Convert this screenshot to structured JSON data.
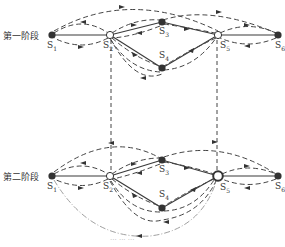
{
  "stages": [
    {
      "label": "第一阶段",
      "y": 35
    },
    {
      "label": "第二阶段",
      "y": 176
    }
  ],
  "nodes": {
    "stage1": [
      {
        "id": "S1",
        "name": "S",
        "sub": "1",
        "x": 52,
        "y": 35,
        "style": "filled"
      },
      {
        "id": "S2",
        "name": "S",
        "sub": "2",
        "x": 110,
        "y": 35,
        "style": "hollow"
      },
      {
        "id": "S3",
        "name": "S",
        "sub": "3",
        "x": 162,
        "y": 22,
        "style": "filled"
      },
      {
        "id": "S4",
        "name": "S",
        "sub": "4",
        "x": 162,
        "y": 68,
        "style": "filled"
      },
      {
        "id": "S5",
        "name": "S",
        "sub": "5",
        "x": 218,
        "y": 35,
        "style": "hollow"
      },
      {
        "id": "S6",
        "name": "S",
        "sub": "6",
        "x": 278,
        "y": 35,
        "style": "filled"
      }
    ],
    "stage2": [
      {
        "id": "S1",
        "name": "S",
        "sub": "1",
        "x": 52,
        "y": 176,
        "style": "filled"
      },
      {
        "id": "S2",
        "name": "S",
        "sub": "2",
        "x": 110,
        "y": 176,
        "style": "hollow"
      },
      {
        "id": "S3",
        "name": "S",
        "sub": "3",
        "x": 162,
        "y": 160,
        "style": "filled"
      },
      {
        "id": "S4",
        "name": "S",
        "sub": "4",
        "x": 162,
        "y": 208,
        "style": "filled"
      },
      {
        "id": "S5",
        "name": "S",
        "sub": "5",
        "x": 218,
        "y": 176,
        "style": "hollow-thick"
      },
      {
        "id": "S6",
        "name": "S",
        "sub": "6",
        "x": 278,
        "y": 176,
        "style": "filled"
      }
    ]
  },
  "edges_solid": [
    [
      "S1",
      "S2"
    ],
    [
      "S2",
      "S3"
    ],
    [
      "S2",
      "S4"
    ],
    [
      "S3",
      "S5"
    ],
    [
      "S4",
      "S5"
    ],
    [
      "S5",
      "S6"
    ]
  ],
  "edges_dashed_vertical": [
    [
      "S2",
      "S2"
    ],
    [
      "S5",
      "S5"
    ]
  ],
  "edge_dashdot": [
    "stage2.S1",
    "stage2.S5"
  ],
  "caption": "··· ··· ···",
  "colors": {
    "line": "#3a3a3a",
    "node": "#333333",
    "dash": "#444444",
    "dashdot": "#888888"
  }
}
